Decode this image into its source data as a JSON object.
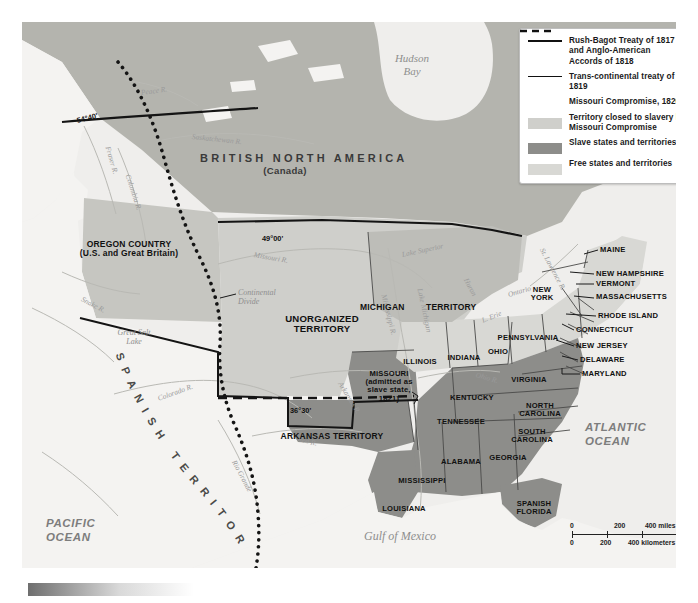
{
  "map": {
    "title_region": "BRITISH NORTH AMERICA",
    "title_region_sub": "(Canada)",
    "colors": {
      "closed_to_slavery": "#cfcfcb",
      "slave_states": "#8d8d8a",
      "free_states": "#d8d8d4",
      "unorganized_bg": "#bdbdb8",
      "canada_bg": "#b4b4ae",
      "ocean": "#efeeec",
      "spanish_territory": "#f4f3f1",
      "boundary_line": "#1a1a1a"
    },
    "oceans": [
      {
        "name": "PACIFIC\nOCEAN",
        "x": 24,
        "y": 494
      },
      {
        "name": "ATLANTIC\nOCEAN",
        "x": 563,
        "y": 398
      }
    ],
    "water_labels": [
      {
        "name": "Hudson\nBay",
        "x": 390,
        "y": 30,
        "size": 11
      },
      {
        "name": "Gulf of Mexico",
        "x": 378,
        "y": 508,
        "size": 12
      },
      {
        "name": "Great Salt\nLake",
        "x": 112,
        "y": 306,
        "size": 8
      },
      {
        "name": "Lake Superior",
        "x": 380,
        "y": 228,
        "size": 7.6,
        "rot": -12
      },
      {
        "name": "Lake Michigan",
        "x": 398,
        "y": 262,
        "size": 7.4,
        "rot": 78
      },
      {
        "name": "Huron",
        "x": 444,
        "y": 252,
        "size": 7.4,
        "rot": 62
      },
      {
        "name": "L. Erie",
        "x": 460,
        "y": 294,
        "size": 7.4,
        "rot": -22
      },
      {
        "name": "Ontario",
        "x": 486,
        "y": 268,
        "size": 7.4,
        "rot": -16
      }
    ],
    "rivers": [
      {
        "name": "Peace R.",
        "x": 119,
        "y": 66,
        "rot": -8
      },
      {
        "name": "Fraser R.",
        "x": 86,
        "y": 120,
        "rot": 74
      },
      {
        "name": "Columbia R.",
        "x": 106,
        "y": 148,
        "rot": 72
      },
      {
        "name": "Saskatchewan R.",
        "x": 170,
        "y": 110,
        "rot": 6
      },
      {
        "name": "Missouri R.",
        "x": 232,
        "y": 228,
        "rot": 10
      },
      {
        "name": "Snake R.",
        "x": 60,
        "y": 272,
        "rot": 28
      },
      {
        "name": "Colorado R.",
        "x": 136,
        "y": 372,
        "rot": -20
      },
      {
        "name": "Rio Grande",
        "x": 212,
        "y": 434,
        "rot": 62
      },
      {
        "name": "Mississippi R.",
        "x": 362,
        "y": 268,
        "rot": 76
      },
      {
        "name": "Arkansas R.",
        "x": 318,
        "y": 356,
        "rot": 58
      },
      {
        "name": "Red R.",
        "x": 276,
        "y": 412,
        "rot": 14
      },
      {
        "name": "Ohio R.",
        "x": 454,
        "y": 348,
        "rot": 16
      },
      {
        "name": "St. Lawrence R.",
        "x": 520,
        "y": 222,
        "rot": 62
      }
    ],
    "coordinates": [
      {
        "name": "54°40'",
        "x": 55,
        "y": 94,
        "rot": -14
      },
      {
        "name": "49°00'",
        "x": 240,
        "y": 212,
        "rot": 0
      },
      {
        "name": "36°30'",
        "x": 268,
        "y": 384,
        "rot": 0
      }
    ],
    "annotations": [
      {
        "name": "Continental\nDivide",
        "x": 196,
        "y": 278
      }
    ],
    "regions": [
      {
        "name": "OREGON COUNTRY\n(U.S. and Great Britain)",
        "x": 107,
        "y": 218,
        "size": 8.5,
        "align": "c"
      },
      {
        "name": "UNORGANIZED\nTERRITORY",
        "x": 300,
        "y": 292,
        "size": 9.6,
        "align": "c"
      },
      {
        "name": "MICHIGAN",
        "x": 366,
        "y": 281,
        "size": 8.5,
        "align": "l"
      },
      {
        "name": "TERRITORY",
        "x": 430,
        "y": 281,
        "size": 8.5,
        "align": "l"
      },
      {
        "name": "ARKANSAS TERRITORY",
        "x": 310,
        "y": 410,
        "size": 8.5,
        "align": "c"
      },
      {
        "name": "SPANISH\nFLORIDA",
        "x": 512,
        "y": 484,
        "size": 8,
        "align": "c"
      },
      {
        "name": "MISSOURI\n(admitted as\nslave state,\n1821)",
        "x": 367,
        "y": 356,
        "size": 7.6,
        "align": "c"
      }
    ],
    "spanish_territory_arc": {
      "letters": [
        "S",
        "P",
        "A",
        "N",
        "I",
        "S",
        "H",
        "T",
        "E",
        "R",
        "R",
        "I",
        "T",
        "O",
        "R",
        "Y"
      ],
      "label": "SPANISH TERRITORY"
    },
    "states": [
      {
        "name": "ILLINOIS",
        "x": 398,
        "y": 340,
        "size": 8
      },
      {
        "name": "INDIANA",
        "x": 440,
        "y": 336,
        "size": 8
      },
      {
        "name": "OHIO",
        "x": 473,
        "y": 330,
        "size": 8
      },
      {
        "name": "KENTUCKY",
        "x": 448,
        "y": 376,
        "size": 8
      },
      {
        "name": "TENNESSEE",
        "x": 437,
        "y": 400,
        "size": 8
      },
      {
        "name": "MISSISSIPPI",
        "x": 398,
        "y": 459,
        "size": 8
      },
      {
        "name": "ALABAMA",
        "x": 437,
        "y": 440,
        "size": 8
      },
      {
        "name": "GEORGIA",
        "x": 484,
        "y": 436,
        "size": 8
      },
      {
        "name": "LOUISIANA",
        "x": 380,
        "y": 487,
        "size": 8
      },
      {
        "name": "VIRGINIA",
        "x": 505,
        "y": 358,
        "size": 8
      },
      {
        "name": "NORTH\nCAROLINA",
        "x": 516,
        "y": 386,
        "size": 8
      },
      {
        "name": "SOUTH\nCAROLINA",
        "x": 508,
        "y": 412,
        "size": 8
      },
      {
        "name": "PENNSYLVANIA",
        "x": 504,
        "y": 316,
        "size": 8
      },
      {
        "name": "NEW\nYORK",
        "x": 516,
        "y": 270,
        "size": 8
      }
    ],
    "callout_states": [
      {
        "name": "MAINE",
        "x": 593,
        "y": 224
      },
      {
        "name": "NEW HAMPSHIRE",
        "x": 593,
        "y": 252
      },
      {
        "name": "VERMONT",
        "x": 593,
        "y": 263
      },
      {
        "name": "MASSACHUSETTS",
        "x": 583,
        "y": 275
      },
      {
        "name": "RHODE ISLAND",
        "x": 590,
        "y": 294
      },
      {
        "name": "CONNECTICUT",
        "x": 567,
        "y": 308
      },
      {
        "name": "NEW JERSEY",
        "x": 568,
        "y": 325
      },
      {
        "name": "DELAWARE",
        "x": 570,
        "y": 339
      },
      {
        "name": "MARYLAND",
        "x": 573,
        "y": 353
      }
    ]
  },
  "legend": {
    "items": [
      {
        "key": "line-solid",
        "label": "Rush-Bagot Treaty of 1817 and\nAnglo-American Accords of 1818"
      },
      {
        "key": "line-solid-thin",
        "label": "Trans-continental treaty of 1819"
      },
      {
        "key": "line-dashed",
        "label": "Missouri Compromise, 1820"
      },
      {
        "key": "swatch",
        "color": "#cfcfcb",
        "label": "Territory closed to slavery by\nMissouri Compromise"
      },
      {
        "key": "swatch",
        "color": "#8d8d8a",
        "label": "Slave states and territories"
      },
      {
        "key": "swatch",
        "color": "#d8d8d4",
        "label": "Free states and territories"
      }
    ]
  },
  "scale": {
    "miles": [
      "0",
      "200",
      "400 miles"
    ],
    "kilometers": [
      "0",
      "200",
      "400 kilometers"
    ]
  }
}
